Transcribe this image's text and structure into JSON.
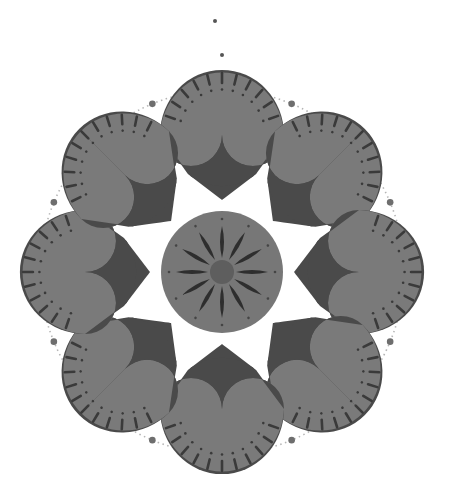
{
  "canvas": {
    "width": 449,
    "height": 478,
    "background": "#ffffff"
  },
  "colors": {
    "petal_light": "#7a7a7a",
    "petal_dark": "#4a4a4a",
    "stroke_dark": "#3a3a3a",
    "center_disc": "#777777",
    "center_hub": "#5e5e5e",
    "dots": "#6e6e6e",
    "dotted_ring": "#b5b5b5"
  },
  "composition": {
    "center": [
      222,
      272
    ],
    "center_disc_radius": 61,
    "hub_radius": 12,
    "center_rays": 12,
    "ring_radius": 182,
    "petal_count": 8,
    "petal_angles_deg": [
      -90,
      -45,
      0,
      45,
      90,
      135,
      180,
      225
    ],
    "ring_dots_count": 8,
    "flower_clusters_count": 8,
    "top_dots": [
      [
        215,
        21
      ],
      [
        222,
        55
      ]
    ]
  }
}
